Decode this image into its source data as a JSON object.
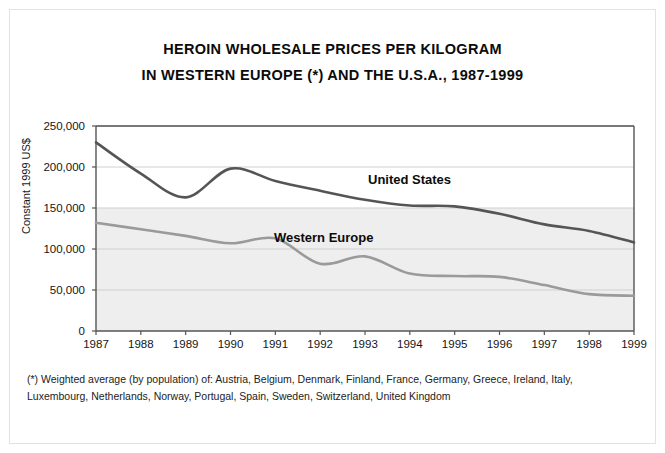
{
  "title": {
    "line1": "HEROIN WHOLESALE PRICES PER KILOGRAM",
    "line2": "IN WESTERN EUROPE (*) AND THE U.S.A., 1987-1999"
  },
  "footnote": {
    "line1": "(*) Weighted average (by population) of: Austria, Belgium, Denmark, Finland, France, Germany, Greece, Ireland, Italy,",
    "line2": "Luxembourg, Netherlands, Norway, Portugal, Spain, Sweden, Switzerland, United Kingdom"
  },
  "labels": {
    "united_states": "United States",
    "western_europe": "Western Europe"
  },
  "colors": {
    "united_states": "#555555",
    "western_europe": "#9a9a9a",
    "plot_band": "#e3e3e3",
    "grid": "#cfcfcf",
    "axis": "#555555"
  },
  "chart_data": {
    "type": "line",
    "title": "HEROIN WHOLESALE PRICES PER KILOGRAM IN WESTERN EUROPE (*) AND THE U.S.A., 1987-1999",
    "xlabel": "",
    "ylabel": "Constant 1999 US$",
    "x": [
      1987,
      1988,
      1989,
      1990,
      1991,
      1992,
      1993,
      1994,
      1995,
      1996,
      1997,
      1998,
      1999
    ],
    "xtick_labels": [
      "1987",
      "1988",
      "1989",
      "1990",
      "1991",
      "1992",
      "1993",
      "1994",
      "1995",
      "1996",
      "1997",
      "1998",
      "1999"
    ],
    "ytick_labels": [
      "0",
      "50,000",
      "100,000",
      "150,000",
      "200,000",
      "250,000"
    ],
    "yticks": [
      0,
      50000,
      100000,
      150000,
      200000,
      250000
    ],
    "ylim": [
      0,
      250000
    ],
    "xlim": [
      1987,
      1999
    ],
    "grid": true,
    "legend": "inline-annotation",
    "series": [
      {
        "name": "United States",
        "color": "#555555",
        "values": [
          230000,
          192000,
          163000,
          198000,
          183000,
          171000,
          160000,
          153000,
          152000,
          143000,
          130000,
          122000,
          108000
        ]
      },
      {
        "name": "Western Europe",
        "color": "#9a9a9a",
        "values": [
          132000,
          124000,
          116000,
          107000,
          113000,
          82000,
          91000,
          70000,
          67000,
          66000,
          56000,
          45000,
          43000
        ]
      }
    ]
  }
}
